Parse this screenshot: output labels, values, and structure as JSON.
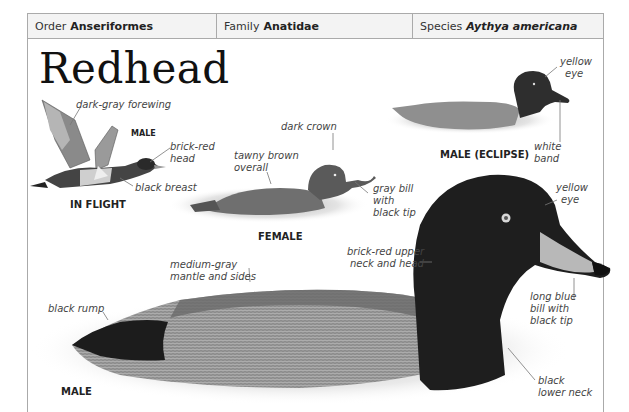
{
  "taxonomy": {
    "order": {
      "prefix": "Order",
      "value": "Anseriformes"
    },
    "family": {
      "prefix": "Family",
      "value": "Anatidae"
    },
    "species": {
      "prefix": "Species",
      "value": "Aythya americana"
    }
  },
  "title": "Redhead",
  "figures": {
    "in_flight": {
      "caption": "IN FLIGHT",
      "sub_caption": "MALE",
      "labels": [
        "dark-gray forewing",
        "brick-red head",
        "black breast"
      ]
    },
    "female": {
      "caption": "FEMALE",
      "labels": [
        "dark crown",
        "tawny brown overall",
        "gray bill with black tip"
      ]
    },
    "male_eclipse": {
      "caption": "MALE (ECLIPSE)",
      "labels": [
        "yellow eye",
        "white band"
      ]
    },
    "male": {
      "caption": "MALE",
      "labels": [
        "yellow eye",
        "brick-red upper neck and head",
        "medium-gray mantle and sides",
        "black rump",
        "long blue bill with black tip",
        "black lower neck"
      ]
    }
  },
  "labels": {
    "forewing": "dark-gray forewing",
    "flight_head_1": "brick-red",
    "flight_head_2": "head",
    "flight_breast": "black breast",
    "female_crown": "dark crown",
    "female_overall_1": "tawny brown",
    "female_overall_2": "overall",
    "female_bill_1": "gray bill",
    "female_bill_2": "with",
    "female_bill_3": "black tip",
    "eclipse_eye_1": "yellow",
    "eclipse_eye_2": "eye",
    "eclipse_band_1": "white",
    "eclipse_band_2": "band",
    "male_eye_1": "yellow",
    "male_eye_2": "eye",
    "male_neck_1": "brick-red upper",
    "male_neck_2": "neck and head",
    "male_mantle_1": "medium-gray",
    "male_mantle_2": "mantle and sides",
    "male_rump": "black rump",
    "male_bill_1": "long blue",
    "male_bill_2": "bill with",
    "male_bill_3": "black tip",
    "male_lowerneck_1": "black",
    "male_lowerneck_2": "lower neck"
  },
  "captions": {
    "in_flight": "IN FLIGHT",
    "flight_male": "MALE",
    "female": "FEMALE",
    "eclipse": "MALE (ECLIPSE)",
    "male": "MALE"
  }
}
